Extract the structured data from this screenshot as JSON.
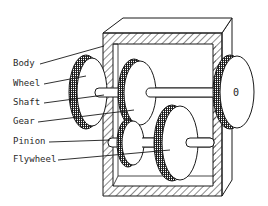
{
  "diagram": {
    "labels": [
      {
        "id": "body",
        "text": "Body",
        "x": 13,
        "y": 61,
        "target": [
          100,
          48
        ]
      },
      {
        "id": "wheel",
        "text": "Wheel",
        "x": 13,
        "y": 80,
        "target": [
          84,
          78
        ]
      },
      {
        "id": "shaft",
        "text": "Shaft",
        "x": 13,
        "y": 100,
        "target": [
          100,
          96
        ]
      },
      {
        "id": "gear",
        "text": "Gear",
        "x": 13,
        "y": 119,
        "target": [
          130,
          110
        ]
      },
      {
        "id": "pinion",
        "text": "Pinion",
        "x": 13,
        "y": 139,
        "target": [
          110,
          141
        ]
      },
      {
        "id": "flywheel",
        "text": "Flywheel",
        "x": 13,
        "y": 157,
        "target": [
          160,
          150
        ]
      }
    ],
    "hub_mark": "0",
    "colors": {
      "line": "#1a1a1a",
      "text": "#2a2a2a",
      "background": "#ffffff"
    }
  }
}
